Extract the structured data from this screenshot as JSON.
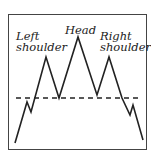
{
  "diagram": {
    "labels": {
      "left_shoulder": [
        "Left",
        "shoulder"
      ],
      "head": [
        "Head"
      ],
      "right_shoulder": [
        "Right",
        "shoulder"
      ]
    },
    "neckline": {
      "style": "dashed",
      "y": 98,
      "x_start": 16,
      "x_end": 139
    },
    "price_path": [
      [
        15,
        143
      ],
      [
        27,
        102
      ],
      [
        31,
        112
      ],
      [
        46,
        57
      ],
      [
        59,
        98
      ],
      [
        78,
        37
      ],
      [
        97,
        95
      ],
      [
        109,
        57
      ],
      [
        122,
        98
      ],
      [
        130,
        115
      ],
      [
        133,
        105
      ],
      [
        143,
        140
      ]
    ],
    "colors": {
      "line": "#222222",
      "frame": "#444444",
      "background": "#ffffff"
    }
  }
}
